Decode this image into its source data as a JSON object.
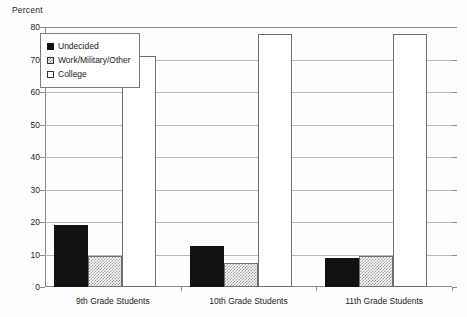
{
  "chart_data": {
    "type": "bar",
    "title": "",
    "subtitle": "",
    "xlabel": "",
    "ylabel": "Percent",
    "ylim": [
      0,
      80
    ],
    "ytick_labels": [
      "0",
      "10",
      "20",
      "30",
      "40",
      "50",
      "60",
      "70",
      "80"
    ],
    "ytick_values": [
      0,
      10,
      20,
      30,
      40,
      50,
      60,
      70,
      80
    ],
    "grid": true,
    "legend_position": "top-left-inside",
    "categories": [
      "9th Grade Students",
      "10th Grade Students",
      "11th Grade Students"
    ],
    "series": [
      {
        "name": "Undecided",
        "values": [
          19,
          12.5,
          9
        ],
        "color": "#111111",
        "pattern": "solid"
      },
      {
        "name": "Work/Military/Other",
        "values": [
          9.5,
          7.5,
          9.5
        ],
        "color": "#9a9a9a",
        "pattern": "checker"
      },
      {
        "name": "College",
        "values": [
          71,
          78,
          78
        ],
        "color": "#ffffff",
        "pattern": "empty"
      }
    ]
  },
  "axis": {
    "y_title": "Percent"
  },
  "legend": {
    "entries": [
      {
        "label": "Undecided"
      },
      {
        "label": "Work/Military/Other"
      },
      {
        "label": "College"
      }
    ]
  },
  "ticks": {
    "y": [
      {
        "label": "80"
      },
      {
        "label": "70"
      },
      {
        "label": "60"
      },
      {
        "label": "50"
      },
      {
        "label": "40"
      },
      {
        "label": "30"
      },
      {
        "label": "20"
      },
      {
        "label": "10"
      },
      {
        "label": "0"
      }
    ]
  },
  "groups": [
    {
      "label": "9th Grade Students"
    },
    {
      "label": "10th Grade Students"
    },
    {
      "label": "11th Grade Students"
    }
  ]
}
